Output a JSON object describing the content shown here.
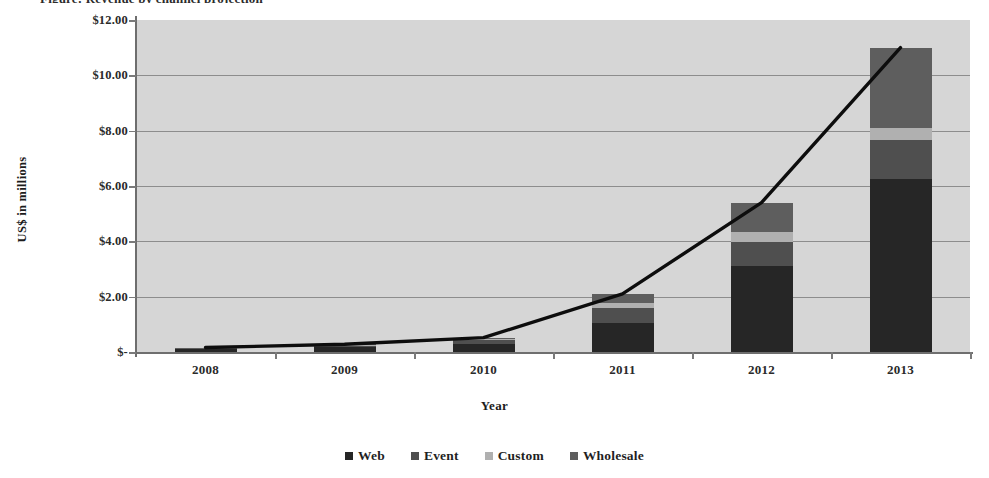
{
  "chart_data": {
    "type": "bar",
    "subtype": "stacked-bar-with-line-overlay",
    "title": "",
    "xlabel": "Year",
    "ylabel": "US$ in millions",
    "categories": [
      "2008",
      "2009",
      "2010",
      "2011",
      "2012",
      "2013"
    ],
    "ylim": [
      0,
      12
    ],
    "ytick_values": [
      0,
      2,
      4,
      6,
      8,
      10,
      12
    ],
    "ytick_labels": [
      "$-",
      "$2.00",
      "$4.00",
      "$6.00",
      "$8.00",
      "$10.00",
      "$12.00"
    ],
    "grid": true,
    "grid_axis": "y",
    "legend_position": "bottom",
    "series": [
      {
        "name": "Web",
        "color": "#262626",
        "values": [
          0.1,
          0.18,
          0.3,
          1.05,
          3.1,
          6.25
        ]
      },
      {
        "name": "Event",
        "color": "#4f4f4f",
        "values": [
          0.03,
          0.05,
          0.12,
          0.55,
          0.87,
          1.4
        ]
      },
      {
        "name": "Custom",
        "color": "#b0b0b0",
        "values": [
          0.01,
          0.02,
          0.05,
          0.18,
          0.36,
          0.45
        ]
      },
      {
        "name": "Wholesale",
        "color": "#5e5e5e",
        "values": [
          0.02,
          0.03,
          0.05,
          0.32,
          1.07,
          2.9
        ]
      }
    ],
    "totals_line": {
      "name": "Total",
      "color": "#0d0d0d",
      "values": [
        0.16,
        0.28,
        0.52,
        2.1,
        5.4,
        11.0
      ]
    },
    "plot_background": "#d6d6d6",
    "gridline_color": "#8d8d8d"
  },
  "legend": {
    "items": [
      {
        "label": "Web",
        "color": "#262626"
      },
      {
        "label": "Event",
        "color": "#4f4f4f"
      },
      {
        "label": "Custom",
        "color": "#b0b0b0"
      },
      {
        "label": "Wholesale",
        "color": "#5e5e5e"
      }
    ]
  },
  "title_sliver": "Figure: Revenue by channel projection"
}
